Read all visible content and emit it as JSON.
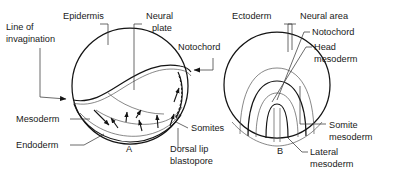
{
  "figure": {
    "background_color": "#ffffff",
    "ink_color": "#141414",
    "panels": [
      {
        "id": "A",
        "letter": "A",
        "letter_x": 126,
        "letter_y": 152
      },
      {
        "id": "B",
        "letter": "B",
        "letter_x": 277,
        "letter_y": 154
      }
    ]
  },
  "panel_a": {
    "labels": [
      {
        "name": "line-of-invagination",
        "lines": [
          "Line of",
          "invagination"
        ],
        "x": 6,
        "y": 30
      },
      {
        "name": "epidermis",
        "lines": [
          "Epidermis"
        ],
        "x": 63,
        "y": 19
      },
      {
        "name": "neural-plate",
        "lines": [
          "Neural",
          "plate"
        ],
        "x": 146,
        "y": 19
      },
      {
        "name": "notochord",
        "lines": [
          "Notochord"
        ],
        "x": 178,
        "y": 50
      },
      {
        "name": "mesoderm",
        "lines": [
          "Mesoderm"
        ],
        "x": 16,
        "y": 122
      },
      {
        "name": "endoderm",
        "lines": [
          "Endoderm"
        ],
        "x": 16,
        "y": 148
      },
      {
        "name": "somites",
        "lines": [
          "Somites"
        ],
        "x": 191,
        "y": 131
      },
      {
        "name": "dorsal-lip-blastopore",
        "lines": [
          "Dorsal lip",
          "blastopore"
        ],
        "x": 170,
        "y": 152
      }
    ]
  },
  "panel_b": {
    "labels": [
      {
        "name": "ectoderm",
        "lines": [
          "Ectoderm"
        ],
        "x": 232,
        "y": 19
      },
      {
        "name": "neural-area",
        "lines": [
          "Neural area"
        ],
        "x": 300,
        "y": 19
      },
      {
        "name": "notochord",
        "lines": [
          "Notochord"
        ],
        "x": 312,
        "y": 35
      },
      {
        "name": "head-mesoderm",
        "lines": [
          "Head",
          "mesoderm"
        ],
        "x": 314,
        "y": 50
      },
      {
        "name": "somite-mesoderm",
        "lines": [
          "Somite",
          "mesoderm"
        ],
        "x": 329,
        "y": 128
      },
      {
        "name": "lateral-mesoderm",
        "lines": [
          "Lateral",
          "mesoderm"
        ],
        "x": 310,
        "y": 155
      }
    ]
  }
}
